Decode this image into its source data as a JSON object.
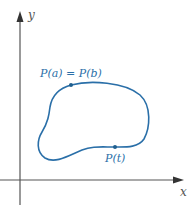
{
  "diagram": {
    "type": "parametric-closed-curve",
    "axes": {
      "x_label": "x",
      "y_label": "y",
      "axis_color": "#555555"
    },
    "curve": {
      "color": "#2a6fa8",
      "description": "closed simple curve"
    },
    "points": [
      {
        "id": "start-end",
        "label": "P(a) = P(b)",
        "x": 71,
        "y": 85
      },
      {
        "id": "general",
        "label": "P(t)",
        "x": 115,
        "y": 147
      }
    ]
  }
}
